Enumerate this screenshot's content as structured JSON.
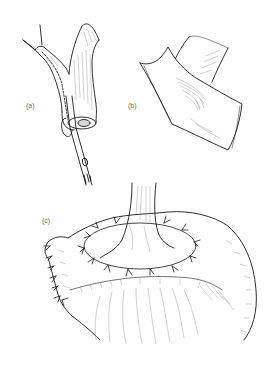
{
  "figure": {
    "panels": [
      {
        "id": "a",
        "label": "(a)",
        "description": "Bifurcating vessel with catheter inserted into its cut end"
      },
      {
        "id": "b",
        "label": "(b)",
        "description": "Vessel attached to opened patch of tissue"
      },
      {
        "id": "c",
        "label": "(c)",
        "description": "Vessel anastomosed onto organ with interrupted sutures"
      }
    ]
  },
  "colors": {
    "background": "#ffffff",
    "ink": "#1a1a1a",
    "label": "#6a6a6a",
    "hatch": "#8a8a8a"
  }
}
